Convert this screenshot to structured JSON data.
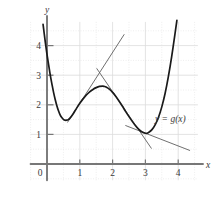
{
  "chart_data": {
    "type": "line",
    "title": "",
    "xlabel": "x",
    "ylabel": "y",
    "curve_label": "y = g(x)",
    "xlim": [
      -0.5,
      4.6
    ],
    "ylim": [
      -0.55,
      4.8
    ],
    "grid": true,
    "grid_color": "#dcdcdc",
    "axis_color": "#777777",
    "curve_color": "#1a1a1a",
    "tangent_color": "#555555",
    "legend_position": "none",
    "xticks": [
      {
        "value": 0,
        "label": "0"
      },
      {
        "value": 1,
        "label": "1"
      },
      {
        "value": 2,
        "label": "2"
      },
      {
        "value": 3,
        "label": "3"
      },
      {
        "value": 4,
        "label": "4"
      }
    ],
    "yticks": [
      {
        "value": 1,
        "label": "1"
      },
      {
        "value": 2,
        "label": "2"
      },
      {
        "value": 3,
        "label": "3"
      },
      {
        "value": 4,
        "label": "4"
      }
    ],
    "series": [
      {
        "name": "g(x)",
        "points": [
          [
            -0.12,
            4.72
          ],
          [
            -0.05,
            4.1
          ],
          [
            0.0,
            3.7
          ],
          [
            0.05,
            3.35
          ],
          [
            0.1,
            3.0
          ],
          [
            0.15,
            2.7
          ],
          [
            0.2,
            2.42
          ],
          [
            0.25,
            2.18
          ],
          [
            0.3,
            1.97
          ],
          [
            0.35,
            1.8
          ],
          [
            0.4,
            1.66
          ],
          [
            0.45,
            1.57
          ],
          [
            0.5,
            1.51
          ],
          [
            0.55,
            1.48
          ],
          [
            0.6,
            1.48
          ],
          [
            0.65,
            1.5
          ],
          [
            0.7,
            1.55
          ],
          [
            0.8,
            1.7
          ],
          [
            0.9,
            1.88
          ],
          [
            1.0,
            2.05
          ],
          [
            1.1,
            2.2
          ],
          [
            1.2,
            2.33
          ],
          [
            1.3,
            2.44
          ],
          [
            1.4,
            2.52
          ],
          [
            1.5,
            2.58
          ],
          [
            1.6,
            2.62
          ],
          [
            1.7,
            2.63
          ],
          [
            1.75,
            2.62
          ],
          [
            1.8,
            2.6
          ],
          [
            1.9,
            2.53
          ],
          [
            2.0,
            2.42
          ],
          [
            2.1,
            2.28
          ],
          [
            2.2,
            2.12
          ],
          [
            2.3,
            1.95
          ],
          [
            2.4,
            1.77
          ],
          [
            2.5,
            1.6
          ],
          [
            2.6,
            1.44
          ],
          [
            2.7,
            1.29
          ],
          [
            2.8,
            1.17
          ],
          [
            2.9,
            1.08
          ],
          [
            3.0,
            1.04
          ],
          [
            3.05,
            1.04
          ],
          [
            3.1,
            1.07
          ],
          [
            3.2,
            1.16
          ],
          [
            3.3,
            1.33
          ],
          [
            3.4,
            1.58
          ],
          [
            3.5,
            1.93
          ],
          [
            3.6,
            2.38
          ],
          [
            3.7,
            2.95
          ],
          [
            3.8,
            3.62
          ],
          [
            3.9,
            4.38
          ],
          [
            3.96,
            4.85
          ]
        ]
      }
    ],
    "tangents": [
      {
        "name": "tangent-at-x1",
        "point_of_tangency": [
          1.0,
          2.05
        ],
        "slope": 1.72,
        "x_start": 0.63,
        "x_end": 2.35
      },
      {
        "name": "tangent-at-x2-2",
        "point_of_tangency": [
          2.2,
          2.12
        ],
        "slope": -1.62,
        "x_start": 1.52,
        "x_end": 3.18
      },
      {
        "name": "tangent-at-x3",
        "point_of_tangency": [
          3.0,
          1.04
        ],
        "slope": -0.43,
        "x_start": 2.4,
        "x_end": 4.35
      }
    ]
  }
}
